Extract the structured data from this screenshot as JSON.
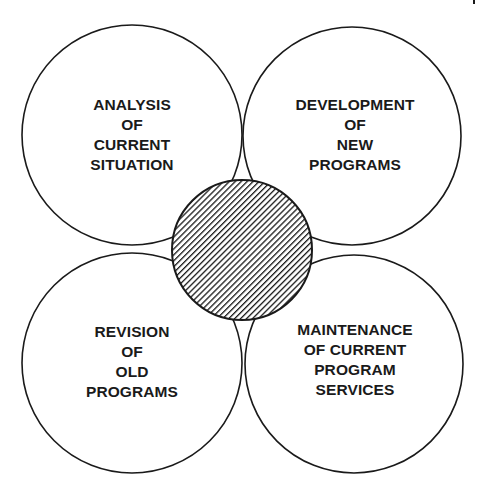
{
  "diagram": {
    "type": "four-circle cycle with central hub",
    "colors": {
      "stroke": "#1a1a1a",
      "background": "#ffffff",
      "hatch": "#1a1a1a"
    },
    "circles": [
      {
        "id": "top-left",
        "lines": [
          "ANALYSIS",
          "OF",
          "CURRENT",
          "SITUATION"
        ]
      },
      {
        "id": "top-right",
        "lines": [
          "DEVELOPMENT",
          "OF",
          "NEW",
          "PROGRAMS"
        ]
      },
      {
        "id": "bottom-left",
        "lines": [
          "REVISION",
          "OF",
          "OLD",
          "PROGRAMS"
        ]
      },
      {
        "id": "bottom-right",
        "lines": [
          "MAINTENANCE",
          "OF CURRENT",
          "PROGRAM",
          "SERVICES"
        ]
      }
    ],
    "hub": {
      "fill": "diagonal-hatch"
    }
  }
}
